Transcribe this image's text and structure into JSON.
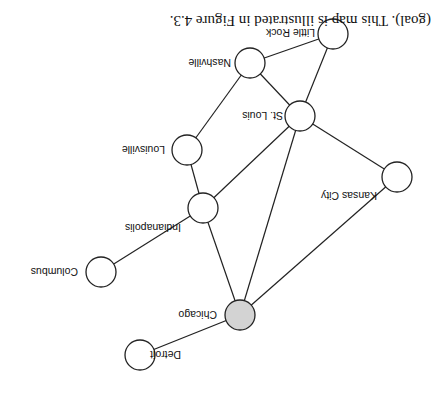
{
  "figure": {
    "caption": "(goal). This map is illustrated in Figure 4.3.",
    "orientation_deg": 180,
    "node_radius": 15,
    "colors": {
      "edge": "#222222",
      "node_fill": "#ffffff",
      "goal_fill": "#d3d3d3"
    }
  },
  "nodes": [
    {
      "id": "detroit",
      "label": "Detroit",
      "x": 303,
      "y": 49,
      "goal": false
    },
    {
      "id": "chicago",
      "label": "Chicago",
      "x": 203,
      "y": 89,
      "goal": true
    },
    {
      "id": "columbus",
      "label": "Columbus",
      "x": 342,
      "y": 132,
      "goal": false
    },
    {
      "id": "indianapolis",
      "label": "Indianapolis",
      "x": 240,
      "y": 196,
      "goal": false
    },
    {
      "id": "kansas_city",
      "label": "Kansas City",
      "x": 46,
      "y": 227,
      "goal": false
    },
    {
      "id": "louisville",
      "label": "Louisville",
      "x": 256,
      "y": 254,
      "goal": false
    },
    {
      "id": "st_louis",
      "label": "St. Louis",
      "x": 143,
      "y": 288,
      "goal": false
    },
    {
      "id": "nashville",
      "label": "Nashville",
      "x": 193,
      "y": 341,
      "goal": false
    },
    {
      "id": "little_rock",
      "label": "Little Rock",
      "x": 110,
      "y": 370,
      "goal": false
    }
  ],
  "edges": [
    [
      "chicago",
      "detroit"
    ],
    [
      "chicago",
      "indianapolis"
    ],
    [
      "chicago",
      "st_louis"
    ],
    [
      "chicago",
      "kansas_city"
    ],
    [
      "indianapolis",
      "columbus"
    ],
    [
      "indianapolis",
      "louisville"
    ],
    [
      "indianapolis",
      "st_louis"
    ],
    [
      "louisville",
      "nashville"
    ],
    [
      "st_louis",
      "kansas_city"
    ],
    [
      "st_louis",
      "nashville"
    ],
    [
      "st_louis",
      "little_rock"
    ],
    [
      "nashville",
      "little_rock"
    ]
  ],
  "labels": {
    "detroit": {
      "x": 262,
      "y": 53
    },
    "chicago": {
      "x": 226,
      "y": 93
    },
    "columbus": {
      "x": 365,
      "y": 136
    },
    "indianapolis": {
      "x": 262,
      "y": 180
    },
    "kansas_city": {
      "x": 66,
      "y": 212
    },
    "louisville": {
      "x": 278,
      "y": 258
    },
    "st_louis": {
      "x": 160,
      "y": 292
    },
    "nashville": {
      "x": 212,
      "y": 345
    },
    "little_rock": {
      "x": 128,
      "y": 375
    }
  }
}
